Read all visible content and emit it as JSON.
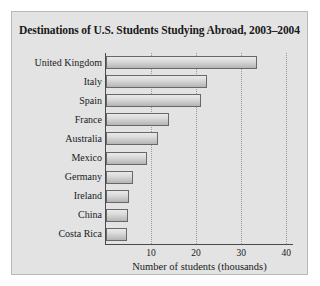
{
  "chart_data": {
    "type": "bar",
    "orientation": "horizontal",
    "title": "Destinations of U.S. Students Studying Abroad, 2003–2004",
    "xlabel": "Number of students (thousands)",
    "ylabel": "",
    "categories": [
      "United Kingdom",
      "Italy",
      "Spain",
      "France",
      "Australia",
      "Mexico",
      "Germany",
      "Ireland",
      "China",
      "Costa Rica"
    ],
    "values": [
      33.5,
      22.5,
      21.0,
      14.0,
      11.5,
      9.0,
      6.0,
      5.2,
      4.9,
      4.7
    ],
    "xlim": [
      0,
      41.5
    ],
    "xticks": [
      10,
      20,
      30,
      40
    ],
    "xtick_labels": [
      "10",
      "20",
      "30",
      "40"
    ],
    "grid": "vertical-dotted",
    "legend": "none",
    "bar_fill": "#d8d8d8",
    "bar_edge": "#686868",
    "panel_background": "#e3e3e3",
    "axis_color": "#4a4a4a"
  }
}
